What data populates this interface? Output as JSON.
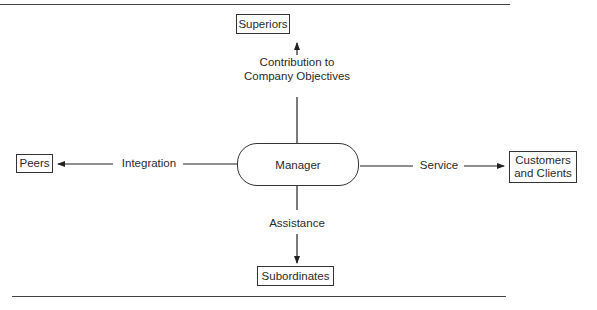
{
  "diagram": {
    "center": {
      "label": "Manager"
    },
    "nodes": {
      "top": {
        "label": "Superiors"
      },
      "left": {
        "label": "Peers"
      },
      "right": {
        "label_line1": "Customers",
        "label_line2": "and Clients"
      },
      "bottom": {
        "label": "Subordinates"
      }
    },
    "edges": {
      "top": {
        "line1": "Contribution to",
        "line2": "Company Objectives"
      },
      "left": {
        "label": "Integration"
      },
      "right": {
        "label": "Service"
      },
      "bottom": {
        "label": "Assistance"
      }
    }
  }
}
